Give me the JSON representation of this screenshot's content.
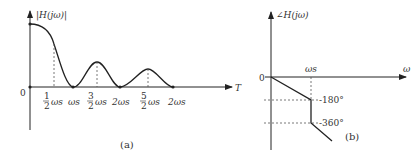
{
  "panel_a": {
    "y_label": "|H(jω)|",
    "x_label": "T",
    "origin_label": "0",
    "ticks": [
      {
        "num": "1",
        "den": "2",
        "sym": "ωs"
      },
      {
        "num": "",
        "den": "",
        "sym": "ωs"
      },
      {
        "num": "3",
        "den": "2",
        "sym": "ωs"
      },
      {
        "num": "",
        "den": "",
        "sym": "2ωs"
      },
      {
        "num": "5",
        "den": "2",
        "sym": "ωs"
      },
      {
        "num": "",
        "den": "",
        "sym": "2ωs"
      }
    ],
    "caption": "(a)"
  },
  "panel_b": {
    "y_label": "∠H(jω)",
    "x_label": "ω",
    "origin_label": "0",
    "x_tick": "ωs",
    "y_ticks": [
      "-180°",
      "-360°"
    ],
    "caption": "(b)"
  },
  "colors": {
    "line": "#222222",
    "dashed": "#555555"
  }
}
